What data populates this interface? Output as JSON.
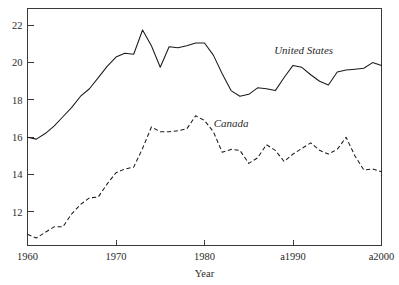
{
  "figure": {
    "clipped_header": "",
    "background_color": "#ffffff",
    "ink_color": "#1a1a1a"
  },
  "chart_data": {
    "type": "line",
    "title": "",
    "xlabel": "Year",
    "ylabel": "",
    "grid": false,
    "legend_position": "inline-annotation",
    "xlim": [
      1960,
      2000
    ],
    "ylim": [
      10.2,
      22.9
    ],
    "xticks": [
      1960,
      1970,
      1980,
      1990,
      2000
    ],
    "xtick_labels": [
      "1960",
      "1970",
      "1980",
      "a1990",
      "a2000"
    ],
    "yticks": [
      12,
      14,
      16,
      18,
      20,
      22
    ],
    "ytick_labels": [
      "12",
      "14",
      "16",
      "18",
      "20",
      "22"
    ],
    "x": [
      1960,
      1961,
      1962,
      1963,
      1964,
      1965,
      1966,
      1967,
      1968,
      1969,
      1970,
      1971,
      1972,
      1973,
      1974,
      1975,
      1976,
      1977,
      1978,
      1979,
      1980,
      1981,
      1982,
      1983,
      1984,
      1985,
      1986,
      1987,
      1988,
      1989,
      1990,
      1991,
      1992,
      1993,
      1994,
      1995,
      1996,
      1997,
      1998,
      1999,
      2000
    ],
    "series": [
      {
        "name": "United States",
        "style": "solid",
        "label_x": 1991.2,
        "label_y": 20.45,
        "values": [
          16.0,
          15.9,
          16.2,
          16.6,
          17.1,
          17.6,
          18.2,
          18.6,
          19.2,
          19.8,
          20.3,
          20.5,
          20.45,
          21.75,
          20.9,
          19.75,
          20.85,
          20.8,
          20.9,
          21.05,
          21.05,
          20.4,
          19.4,
          18.5,
          18.2,
          18.3,
          18.65,
          18.6,
          18.5,
          19.2,
          19.85,
          19.75,
          19.35,
          19.0,
          18.8,
          19.5,
          19.6,
          19.65,
          19.7,
          20.0,
          19.85
        ]
      },
      {
        "name": "Canada",
        "style": "dashed",
        "label_x": 1983.0,
        "label_y": 16.55,
        "values": [
          10.8,
          10.6,
          10.9,
          11.2,
          11.2,
          11.9,
          12.4,
          12.75,
          12.8,
          13.5,
          14.1,
          14.3,
          14.4,
          15.4,
          16.55,
          16.3,
          16.3,
          16.35,
          16.45,
          17.15,
          16.9,
          16.3,
          15.2,
          15.35,
          15.3,
          14.6,
          14.9,
          15.6,
          15.3,
          14.7,
          15.1,
          15.4,
          15.7,
          15.3,
          15.1,
          15.35,
          16.0,
          15.0,
          14.25,
          14.3,
          14.15
        ]
      }
    ]
  },
  "axis": {
    "x_title": "Year"
  }
}
